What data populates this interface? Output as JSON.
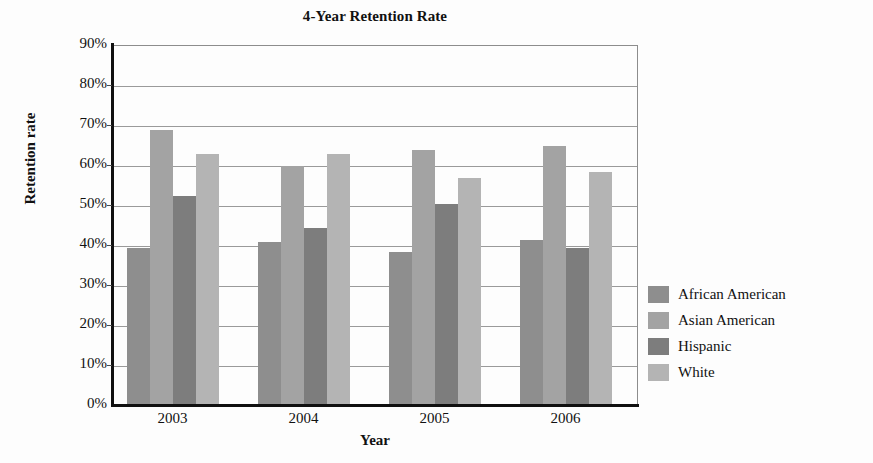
{
  "chart_data": {
    "type": "bar",
    "title": "4-Year Retention Rate",
    "xlabel": "Year",
    "ylabel": "Retention rate",
    "categories": [
      "2003",
      "2004",
      "2005",
      "2006"
    ],
    "series": [
      {
        "name": "African American",
        "color": "#8e8e8e",
        "values": [
          39.5,
          41.0,
          38.5,
          41.5
        ]
      },
      {
        "name": "Asian American",
        "color": "#a3a3a3",
        "values": [
          69.0,
          60.0,
          64.0,
          65.0
        ]
      },
      {
        "name": "Hispanic",
        "color": "#7d7d7d",
        "values": [
          52.5,
          44.5,
          50.5,
          39.5
        ]
      },
      {
        "name": "White",
        "color": "#b4b4b4",
        "values": [
          63.0,
          63.0,
          57.0,
          58.5
        ]
      }
    ],
    "ylim": [
      0,
      90
    ],
    "ytick_values": [
      0,
      10,
      20,
      30,
      40,
      50,
      60,
      70,
      80,
      90
    ],
    "ytick_labels": [
      "0%",
      "10%",
      "20%",
      "30%",
      "40%",
      "50%",
      "60%",
      "70%",
      "80%",
      "90%"
    ],
    "grid": true,
    "legend_position": "right",
    "value_format": "percent"
  }
}
